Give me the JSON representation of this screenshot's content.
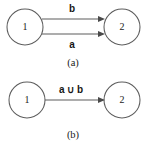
{
  "figure": {
    "panels": [
      {
        "id": "panel-a",
        "caption": "(a)",
        "nodes": [
          {
            "id": "node-a-1",
            "label": "1",
            "cx": 25,
            "cy": 27,
            "r": 18
          },
          {
            "id": "node-a-2",
            "label": "2",
            "cx": 122,
            "cy": 27,
            "r": 18
          }
        ],
        "edges": [
          {
            "id": "edge-a-b",
            "label": "b",
            "from": "1",
            "to": "2",
            "x1": 42,
            "y1": 19,
            "x2": 105,
            "y2": 19,
            "label_x": 72,
            "label_y": 12
          },
          {
            "id": "edge-a-a",
            "label": "a",
            "from": "1",
            "to": "2",
            "x1": 42,
            "y1": 34,
            "x2": 105,
            "y2": 34,
            "label_x": 72,
            "label_y": 48
          }
        ],
        "caption_x": 73,
        "caption_y": 65
      },
      {
        "id": "panel-b",
        "caption": "(b)",
        "nodes": [
          {
            "id": "node-b-1",
            "label": "1",
            "cx": 27,
            "cy": 100,
            "r": 18
          },
          {
            "id": "node-b-2",
            "label": "2",
            "cx": 122,
            "cy": 100,
            "r": 18
          }
        ],
        "edges": [
          {
            "id": "edge-b-union",
            "label": "a ∪ b",
            "from": "1",
            "to": "2",
            "x1": 45,
            "y1": 100,
            "x2": 105,
            "y2": 100,
            "label_x": 71,
            "label_y": 93
          }
        ],
        "caption_x": 73,
        "caption_y": 137
      }
    ],
    "colors": {
      "background": "#ffffff",
      "stroke": "#5d5d5d",
      "arrow_fill": "#4a4a4a",
      "text": "#1a1a1a"
    }
  }
}
